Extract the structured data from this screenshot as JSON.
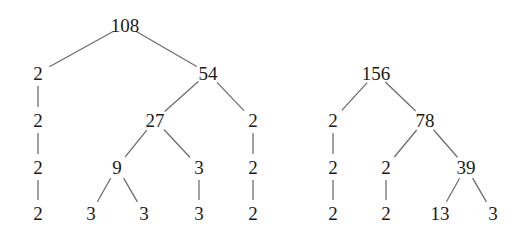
{
  "diagram": {
    "type": "factor-trees",
    "edge_color": "#6e6e6e",
    "text_color": "#1a1a1a",
    "trees": [
      {
        "root": "108",
        "nodes": [
          {
            "id": "a0",
            "label": "108",
            "x": 125,
            "y": 25
          },
          {
            "id": "a1",
            "label": "2",
            "x": 38,
            "y": 73
          },
          {
            "id": "a2",
            "label": "54",
            "x": 208,
            "y": 73
          },
          {
            "id": "a3",
            "label": "2",
            "x": 38,
            "y": 120
          },
          {
            "id": "a4",
            "label": "27",
            "x": 155,
            "y": 120
          },
          {
            "id": "a5",
            "label": "2",
            "x": 253,
            "y": 120
          },
          {
            "id": "a6",
            "label": "2",
            "x": 38,
            "y": 167
          },
          {
            "id": "a7",
            "label": "9",
            "x": 117,
            "y": 167
          },
          {
            "id": "a8",
            "label": "3",
            "x": 199,
            "y": 167
          },
          {
            "id": "a9",
            "label": "2",
            "x": 253,
            "y": 167
          },
          {
            "id": "a10",
            "label": "2",
            "x": 38,
            "y": 213
          },
          {
            "id": "a11",
            "label": "3",
            "x": 91,
            "y": 213
          },
          {
            "id": "a12",
            "label": "3",
            "x": 144,
            "y": 213
          },
          {
            "id": "a13",
            "label": "3",
            "x": 199,
            "y": 213
          },
          {
            "id": "a14",
            "label": "2",
            "x": 253,
            "y": 213
          }
        ],
        "edges": [
          [
            "a0",
            "a1"
          ],
          [
            "a0",
            "a2"
          ],
          [
            "a1",
            "a3"
          ],
          [
            "a2",
            "a4"
          ],
          [
            "a2",
            "a5"
          ],
          [
            "a3",
            "a6"
          ],
          [
            "a4",
            "a7"
          ],
          [
            "a4",
            "a8"
          ],
          [
            "a5",
            "a9"
          ],
          [
            "a6",
            "a10"
          ],
          [
            "a7",
            "a11"
          ],
          [
            "a7",
            "a12"
          ],
          [
            "a8",
            "a13"
          ],
          [
            "a9",
            "a14"
          ]
        ]
      },
      {
        "root": "156",
        "nodes": [
          {
            "id": "b0",
            "label": "156",
            "x": 376,
            "y": 73
          },
          {
            "id": "b1",
            "label": "2",
            "x": 333,
            "y": 120
          },
          {
            "id": "b2",
            "label": "78",
            "x": 425,
            "y": 120
          },
          {
            "id": "b3",
            "label": "2",
            "x": 333,
            "y": 167
          },
          {
            "id": "b4",
            "label": "2",
            "x": 386,
            "y": 167
          },
          {
            "id": "b5",
            "label": "39",
            "x": 466,
            "y": 167
          },
          {
            "id": "b6",
            "label": "2",
            "x": 333,
            "y": 213
          },
          {
            "id": "b7",
            "label": "2",
            "x": 386,
            "y": 213
          },
          {
            "id": "b8",
            "label": "13",
            "x": 440,
            "y": 213
          },
          {
            "id": "b9",
            "label": "3",
            "x": 493,
            "y": 213
          }
        ],
        "edges": [
          [
            "b0",
            "b1"
          ],
          [
            "b0",
            "b2"
          ],
          [
            "b1",
            "b3"
          ],
          [
            "b2",
            "b4"
          ],
          [
            "b2",
            "b5"
          ],
          [
            "b3",
            "b6"
          ],
          [
            "b4",
            "b7"
          ],
          [
            "b5",
            "b8"
          ],
          [
            "b5",
            "b9"
          ]
        ]
      }
    ]
  }
}
